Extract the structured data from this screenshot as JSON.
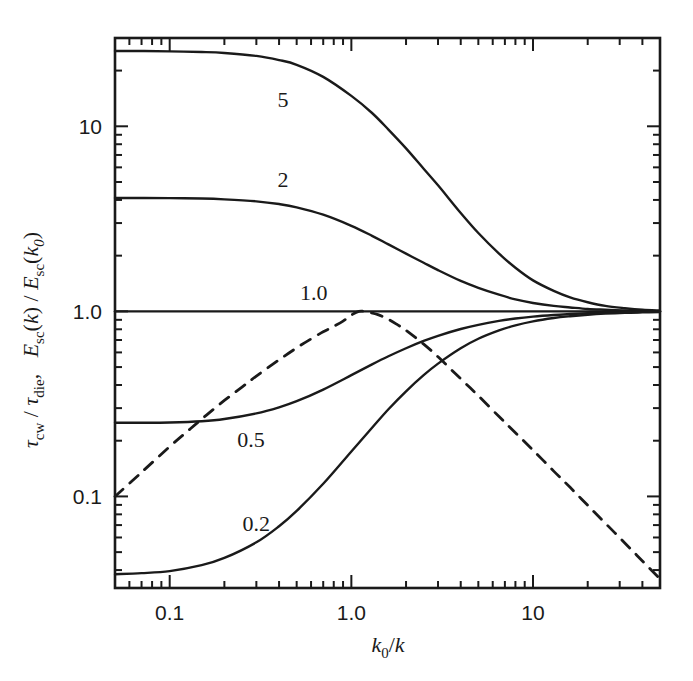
{
  "figure": {
    "background_color": "#ffffff",
    "ink_color": "#1a1a1a"
  },
  "axes": {
    "x": {
      "label_parts": {
        "k": "k",
        "zero": "0",
        "slash": "/",
        "k2": "k"
      },
      "label_text": "k0/k",
      "scale": "log",
      "min": 0.05,
      "max": 50,
      "tick_labels": [
        "0.1",
        "1.0",
        "10"
      ],
      "tick_values": [
        0.1,
        1.0,
        10
      ]
    },
    "y": {
      "label_text": "tau_cw / tau_die ,   E_sc(k) / E_sc(k0)",
      "label_parts": {
        "tau": "τ",
        "cw": "cw",
        "slash1": "/",
        "tau2": "τ",
        "die": "die",
        "comma": ",",
        "E1": "E",
        "sc1": "sc",
        "open1": "(",
        "k1": "k",
        "close1": ")",
        "slash2": "/",
        "E2": "E",
        "sc2": "sc",
        "open2": "(",
        "k2": "k",
        "sub0": "0",
        "close2": ")"
      },
      "scale": "log",
      "min": 0.032,
      "max": 30,
      "tick_labels": [
        "0.1",
        "1.0",
        "10"
      ],
      "tick_values": [
        0.1,
        1.0,
        10
      ]
    }
  },
  "chart_data": {
    "type": "line",
    "title": "",
    "xlabel": "k0/k",
    "ylabel": "tau_cw / tau_die , E_sc(k) / E_sc(k0)",
    "xscale": "log",
    "yscale": "log",
    "xlim": [
      0.05,
      50
    ],
    "ylim": [
      0.032,
      30
    ],
    "grid": false,
    "legend": "inline-curve-labels",
    "series": [
      {
        "name": "5",
        "label": "5",
        "style": "solid",
        "label_x": 0.42,
        "label_y": 14.0,
        "plateau_low": 25.5,
        "plateau_high": 1.0,
        "points": [
          [
            0.05,
            25.5
          ],
          [
            0.07,
            25.5
          ],
          [
            0.1,
            25.4
          ],
          [
            0.15,
            25.2
          ],
          [
            0.2,
            24.9
          ],
          [
            0.3,
            24.0
          ],
          [
            0.4,
            22.8
          ],
          [
            0.5,
            21.5
          ],
          [
            0.7,
            18.5
          ],
          [
            1.0,
            14.6
          ],
          [
            1.3,
            11.8
          ],
          [
            1.6,
            9.6
          ],
          [
            2.0,
            7.6
          ],
          [
            2.5,
            5.9
          ],
          [
            3.0,
            4.8
          ],
          [
            4.0,
            3.4
          ],
          [
            5.0,
            2.65
          ],
          [
            6.5,
            2.05
          ],
          [
            8.0,
            1.72
          ],
          [
            10.0,
            1.47
          ],
          [
            13.0,
            1.29
          ],
          [
            16.0,
            1.19
          ],
          [
            20.0,
            1.12
          ],
          [
            25.0,
            1.07
          ],
          [
            32.0,
            1.04
          ],
          [
            40.0,
            1.02
          ],
          [
            50.0,
            1.01
          ]
        ]
      },
      {
        "name": "2",
        "label": "2",
        "style": "solid",
        "label_x": 0.42,
        "label_y": 5.2,
        "plateau_low": 4.1,
        "plateau_high": 1.0,
        "points": [
          [
            0.05,
            4.1
          ],
          [
            0.07,
            4.1
          ],
          [
            0.1,
            4.09
          ],
          [
            0.15,
            4.07
          ],
          [
            0.2,
            4.03
          ],
          [
            0.3,
            3.93
          ],
          [
            0.4,
            3.8
          ],
          [
            0.5,
            3.65
          ],
          [
            0.7,
            3.33
          ],
          [
            1.0,
            2.9
          ],
          [
            1.3,
            2.56
          ],
          [
            1.6,
            2.3
          ],
          [
            2.0,
            2.05
          ],
          [
            2.5,
            1.83
          ],
          [
            3.0,
            1.67
          ],
          [
            4.0,
            1.46
          ],
          [
            5.0,
            1.34
          ],
          [
            6.5,
            1.23
          ],
          [
            8.0,
            1.16
          ],
          [
            10.0,
            1.11
          ],
          [
            13.0,
            1.07
          ],
          [
            16.0,
            1.05
          ],
          [
            20.0,
            1.03
          ],
          [
            25.0,
            1.02
          ],
          [
            32.0,
            1.01
          ],
          [
            40.0,
            1.005
          ],
          [
            50.0,
            1.0
          ]
        ]
      },
      {
        "name": "1.0",
        "label": "1.0",
        "style": "solid",
        "label_x": 0.62,
        "label_y": 1.28,
        "plateau_low": 1.0,
        "plateau_high": 1.0,
        "points": [
          [
            0.05,
            1.0
          ],
          [
            0.5,
            1.0
          ],
          [
            5.0,
            1.0
          ],
          [
            50.0,
            1.0
          ]
        ]
      },
      {
        "name": "0.5",
        "label": "0.5",
        "style": "solid",
        "label_x": 0.28,
        "label_y": 0.205,
        "plateau_low": 0.25,
        "plateau_high": 1.0,
        "points": [
          [
            0.05,
            0.25
          ],
          [
            0.07,
            0.25
          ],
          [
            0.1,
            0.251
          ],
          [
            0.15,
            0.255
          ],
          [
            0.2,
            0.262
          ],
          [
            0.3,
            0.281
          ],
          [
            0.4,
            0.303
          ],
          [
            0.5,
            0.327
          ],
          [
            0.7,
            0.378
          ],
          [
            1.0,
            0.452
          ],
          [
            1.3,
            0.517
          ],
          [
            1.6,
            0.572
          ],
          [
            2.0,
            0.632
          ],
          [
            2.5,
            0.692
          ],
          [
            3.0,
            0.738
          ],
          [
            4.0,
            0.803
          ],
          [
            5.0,
            0.846
          ],
          [
            6.5,
            0.888
          ],
          [
            8.0,
            0.915
          ],
          [
            10.0,
            0.937
          ],
          [
            13.0,
            0.956
          ],
          [
            16.0,
            0.967
          ],
          [
            20.0,
            0.977
          ],
          [
            25.0,
            0.984
          ],
          [
            32.0,
            0.99
          ],
          [
            40.0,
            0.993
          ],
          [
            50.0,
            0.996
          ]
        ]
      },
      {
        "name": "0.2",
        "label": "0.2",
        "style": "solid",
        "label_x": 0.3,
        "label_y": 0.072,
        "plateau_low": 0.038,
        "plateau_high": 1.0,
        "points": [
          [
            0.05,
            0.038
          ],
          [
            0.07,
            0.0385
          ],
          [
            0.1,
            0.0395
          ],
          [
            0.15,
            0.0425
          ],
          [
            0.2,
            0.0465
          ],
          [
            0.3,
            0.0565
          ],
          [
            0.4,
            0.069
          ],
          [
            0.5,
            0.0835
          ],
          [
            0.7,
            0.117
          ],
          [
            1.0,
            0.175
          ],
          [
            1.3,
            0.235
          ],
          [
            1.6,
            0.296
          ],
          [
            2.0,
            0.37
          ],
          [
            2.5,
            0.452
          ],
          [
            3.0,
            0.522
          ],
          [
            4.0,
            0.632
          ],
          [
            5.0,
            0.711
          ],
          [
            6.5,
            0.789
          ],
          [
            8.0,
            0.84
          ],
          [
            10.0,
            0.883
          ],
          [
            13.0,
            0.92
          ],
          [
            16.0,
            0.941
          ],
          [
            20.0,
            0.959
          ],
          [
            25.0,
            0.972
          ],
          [
            32.0,
            0.982
          ],
          [
            40.0,
            0.987
          ],
          [
            50.0,
            0.991
          ]
        ]
      },
      {
        "name": "dashed",
        "label": "",
        "style": "dashed",
        "peak_x": 1.1,
        "peak_y": 1.0,
        "points": [
          [
            0.05,
            0.1
          ],
          [
            0.07,
            0.135
          ],
          [
            0.1,
            0.186
          ],
          [
            0.13,
            0.232
          ],
          [
            0.16,
            0.276
          ],
          [
            0.2,
            0.33
          ],
          [
            0.25,
            0.39
          ],
          [
            0.3,
            0.447
          ],
          [
            0.4,
            0.547
          ],
          [
            0.5,
            0.635
          ],
          [
            0.6,
            0.71
          ],
          [
            0.7,
            0.775
          ],
          [
            0.8,
            0.83
          ],
          [
            0.9,
            0.885
          ],
          [
            1.0,
            0.955
          ],
          [
            1.1,
            1.0
          ],
          [
            1.2,
            0.995
          ],
          [
            1.4,
            0.96
          ],
          [
            1.6,
            0.905
          ],
          [
            1.8,
            0.845
          ],
          [
            2.0,
            0.79
          ],
          [
            2.5,
            0.665
          ],
          [
            3.0,
            0.568
          ],
          [
            4.0,
            0.432
          ],
          [
            5.0,
            0.35
          ],
          [
            6.5,
            0.27
          ],
          [
            8.0,
            0.221
          ],
          [
            10.0,
            0.178
          ],
          [
            13.0,
            0.137
          ],
          [
            16.0,
            0.112
          ],
          [
            20.0,
            0.0895
          ],
          [
            25.0,
            0.0717
          ],
          [
            32.0,
            0.056
          ],
          [
            40.0,
            0.0448
          ],
          [
            50.0,
            0.0358
          ]
        ]
      }
    ]
  }
}
